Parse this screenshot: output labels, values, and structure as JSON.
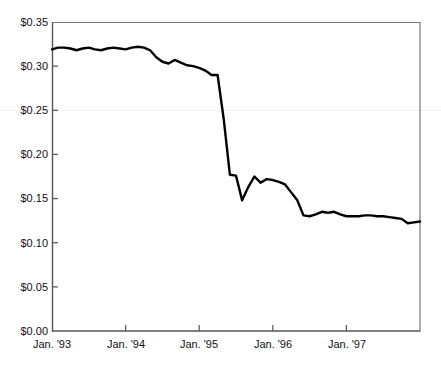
{
  "chart_data": {
    "type": "line",
    "title": "",
    "subtitle": "",
    "xlabel": "",
    "ylabel": "",
    "grid": false,
    "legend": null,
    "legend_position": "none",
    "line_color": "#000000",
    "axis_color": "#4d4d4d",
    "background_color": "#ffffff",
    "xlim": [
      "Jan. '93",
      "Dec. '97"
    ],
    "ylim": [
      0.0,
      0.35
    ],
    "ytick_labels": [
      "$0.35",
      "$0.30",
      "$0.25",
      "$0.20",
      "$0.15",
      "$0.10",
      "$0.05",
      "$0.00"
    ],
    "ytick_values": [
      0.35,
      0.3,
      0.25,
      0.2,
      0.15,
      0.1,
      0.05,
      0.0
    ],
    "xtick_labels": [
      "Jan. '93",
      "Jan. '94",
      "Jan. '95",
      "Jan. '96",
      "Jan. '97"
    ],
    "xtick_values": [
      0,
      12,
      24,
      36,
      48
    ],
    "series": [
      {
        "name": "price",
        "x": [
          0,
          1,
          2,
          3,
          4,
          5,
          6,
          7,
          8,
          9,
          10,
          11,
          12,
          13,
          14,
          15,
          16,
          17,
          18,
          19,
          20,
          21,
          22,
          23,
          24,
          25,
          26,
          27,
          28,
          29,
          30,
          31,
          32,
          33,
          34,
          35,
          36,
          37,
          38,
          39,
          40,
          41,
          42,
          43,
          44,
          45,
          46,
          47,
          48,
          49,
          50,
          51,
          52,
          53,
          54,
          55,
          56,
          57,
          58,
          59,
          60
        ],
        "values": [
          0.319,
          0.321,
          0.321,
          0.32,
          0.318,
          0.32,
          0.321,
          0.319,
          0.318,
          0.32,
          0.321,
          0.32,
          0.319,
          0.321,
          0.322,
          0.321,
          0.318,
          0.31,
          0.305,
          0.303,
          0.307,
          0.304,
          0.301,
          0.3,
          0.298,
          0.295,
          0.29,
          0.29,
          0.24,
          0.177,
          0.176,
          0.148,
          0.163,
          0.175,
          0.168,
          0.172,
          0.171,
          0.169,
          0.166,
          0.157,
          0.148,
          0.131,
          0.13,
          0.132,
          0.135,
          0.134,
          0.135,
          0.132,
          0.13,
          0.13,
          0.13,
          0.131,
          0.131,
          0.13,
          0.13,
          0.129,
          0.128,
          0.127,
          0.122,
          0.123,
          0.124
        ]
      }
    ]
  },
  "axes": {
    "plot_left_px": 52,
    "plot_right_px": 420,
    "plot_top_px": 22,
    "plot_bottom_px": 331
  }
}
